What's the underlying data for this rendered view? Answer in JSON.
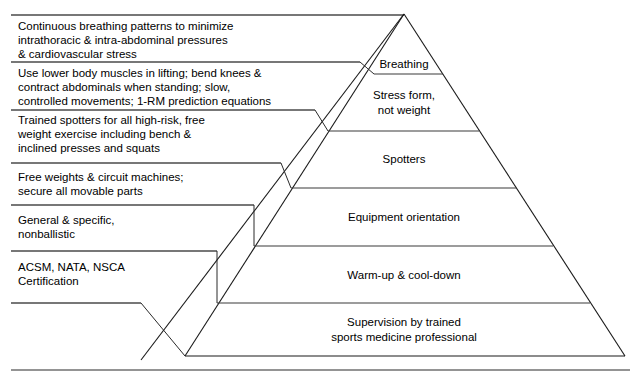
{
  "diagram": {
    "type": "pyramid",
    "colors": {
      "background": "#ffffff",
      "outline": "#1a1a1a",
      "rule": "#4a4a4a",
      "text": "#000000"
    },
    "geometry": {
      "apex": [
        404,
        14
      ],
      "base_left": [
        185,
        356
      ],
      "base_right": [
        625,
        356
      ],
      "footer_rule_y": 370
    },
    "levels": [
      {
        "id": "breathing",
        "tier_label": "Breathing",
        "tier_label_lines": [
          "Breathing"
        ],
        "tier_label_x": 456,
        "tier_label_y": 66,
        "note_lines": [
          "Continuous breathing patterns to minimize",
          "intrathoracic & intra-abdominal pressures",
          "& cardiovascular stress"
        ],
        "note_x": 18,
        "note_y": 30,
        "leader_y": 15,
        "leader_x_start": 11,
        "leader_x_end": 404,
        "divider_y": 74,
        "divider_x_start": 374,
        "divider_x_end": 443
      },
      {
        "id": "stress-form",
        "tier_label": "Stress form, not weight",
        "tier_label_lines": [
          "Stress form,",
          "not weight"
        ],
        "tier_label_x": 443,
        "tier_label_y": 95,
        "note_lines": [
          "Use lower body muscles in lifting; bend knees &",
          "contract abdominals when standing; slow,",
          "controlled movements; 1-RM prediction equations"
        ],
        "note_x": 18,
        "note_y": 77,
        "leader_y": 62,
        "leader_x_start": 11,
        "leader_x_end": 360,
        "divider_y": 131,
        "divider_x_start": 328,
        "divider_x_end": 479
      },
      {
        "id": "spotters",
        "tier_label": "Spotters",
        "tier_label_lines": [
          "Spotters"
        ],
        "tier_label_x": 420,
        "tier_label_y": 159,
        "note_lines": [
          "Trained spotters for all high-risk, free",
          "weight exercise including bench &",
          "inclined presses and squats"
        ],
        "note_x": 18,
        "note_y": 124,
        "leader_y": 110,
        "leader_x_start": 11,
        "leader_x_end": 315,
        "divider_y": 188,
        "divider_x_start": 291,
        "divider_x_end": 516
      },
      {
        "id": "equipment-orientation",
        "tier_label": "Equipment orientation",
        "tier_label_lines": [
          "Equipment orientation"
        ],
        "tier_label_x": 407,
        "tier_label_y": 217,
        "note_lines": [
          "Free weights & circuit machines;",
          "secure all movable parts"
        ],
        "note_x": 18,
        "note_y": 178,
        "leader_y": 163,
        "leader_x_start": 11,
        "leader_x_end": 281,
        "divider_y": 246,
        "divider_x_start": 254,
        "divider_x_end": 553
      },
      {
        "id": "warm-up",
        "tier_label": "Warm-up & cool-down",
        "tier_label_lines": [
          "Warm-up & cool-down"
        ],
        "tier_label_x": 405,
        "tier_label_y": 275,
        "note_lines": [
          "General & specific,",
          "nonballistic"
        ],
        "note_x": 18,
        "note_y": 219,
        "leader_y": 205,
        "leader_x_start": 11,
        "leader_x_end": 254,
        "divider_y": 303,
        "divider_x_start": 217,
        "divider_x_end": 590
      },
      {
        "id": "supervision",
        "tier_label": "Supervision by trained sports medicine professional",
        "tier_label_lines": [
          "Supervision by trained",
          "sports medicine professional"
        ],
        "tier_label_x": 404,
        "tier_label_y": 327,
        "note_lines": [
          "ACSM, NATA, NSCA",
          "Certification"
        ],
        "note_x": 18,
        "note_y": 266,
        "leader_y": 251,
        "leader_x_start": 11,
        "leader_x_end": 217,
        "divider_y": 356,
        "divider_x_start": 185,
        "divider_x_end": 625
      }
    ],
    "extra_rules": [
      {
        "id": "bottom-note-rule",
        "y": 303,
        "x_start": 11,
        "x_end": 141
      }
    ]
  }
}
